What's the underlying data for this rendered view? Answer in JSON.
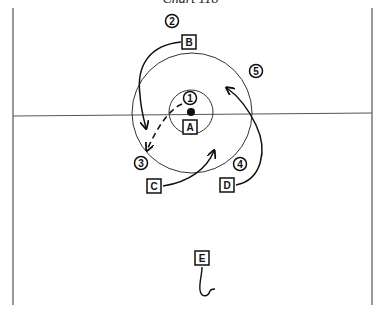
{
  "title": "Chart 118",
  "colors": {
    "ink": "#111111",
    "field_line": "#555555",
    "background": "#ffffff"
  },
  "players": [
    {
      "id": "A",
      "label": "A",
      "x": 190,
      "y": 127
    },
    {
      "id": "B",
      "label": "B",
      "x": 189,
      "y": 42
    },
    {
      "id": "C",
      "label": "C",
      "x": 154,
      "y": 186
    },
    {
      "id": "D",
      "label": "D",
      "x": 227,
      "y": 185
    },
    {
      "id": "E",
      "label": "E",
      "x": 202,
      "y": 258
    }
  ],
  "positions": [
    {
      "id": "1",
      "label": "1",
      "x": 190,
      "y": 98
    },
    {
      "id": "2",
      "label": "2",
      "x": 172,
      "y": 21
    },
    {
      "id": "3",
      "label": "3",
      "x": 141,
      "y": 163
    },
    {
      "id": "4",
      "label": "4",
      "x": 240,
      "y": 164
    },
    {
      "id": "5",
      "label": "5",
      "x": 256,
      "y": 71
    }
  ],
  "ball": {
    "x": 191,
    "y": 112
  },
  "circles": [
    {
      "name": "inner-circle",
      "cx": 191,
      "cy": 112,
      "r": 22
    },
    {
      "name": "outer-circle",
      "cx": 192,
      "cy": 113,
      "r": 60
    }
  ]
}
